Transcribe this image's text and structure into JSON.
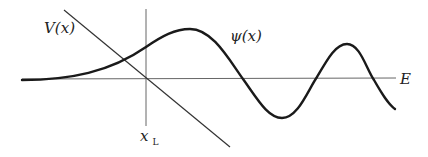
{
  "diagram": {
    "type": "quantum-wavefunction-turning-point",
    "labels": {
      "potential": "V(x)",
      "wavefunction": "ψ(x)",
      "energy": "E",
      "turning_point_main": "x",
      "turning_point_sub": "L"
    },
    "colors": {
      "curve": "#1a1a1a",
      "axis": "#555555",
      "background": "#ffffff"
    },
    "geometry": {
      "energy_line": {
        "x1": 22,
        "y1": 79,
        "x2": 396,
        "y2": 78
      },
      "turning_point_line": {
        "x1": 146,
        "y1": 9,
        "x2": 146,
        "y2": 126
      },
      "potential_line": {
        "x1": 64,
        "y1": 10,
        "x2": 230,
        "y2": 147
      },
      "wavefunction_path": "M22,80 C70,80 110,72 146,47 C162,36 175,29 190,29 C212,29 228,58 243,79 C258,100 268,118 282,118 C298,118 308,90 317,77 C328,58 336,44 347,44 C360,44 366,68 374,80 C382,94 388,104 395,109"
    }
  }
}
